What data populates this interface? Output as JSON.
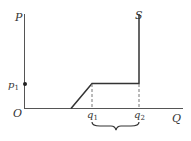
{
  "diagram": {
    "type": "supply-curve",
    "axes": {
      "y_label": "P",
      "x_label": "Q",
      "origin_label": "O"
    },
    "curve_label": "S",
    "price_marker": {
      "label": "p",
      "subscript": "1"
    },
    "quantity_markers": [
      {
        "label": "q",
        "subscript": "1"
      },
      {
        "label": "q",
        "subscript": "2"
      }
    ],
    "brace": {
      "spans": "q1 to q2"
    },
    "colors": {
      "line": "#333333",
      "dashed": "#777777",
      "background": "#ffffff"
    }
  }
}
